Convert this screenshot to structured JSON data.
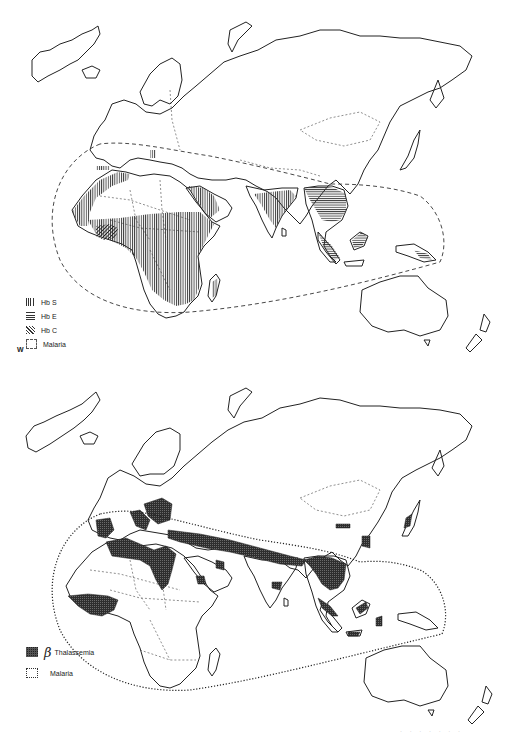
{
  "figure": {
    "panels": [
      {
        "id": "top",
        "title": "Hemoglobin variants and malaria distribution",
        "legend": [
          {
            "label": "Hb S",
            "pattern": "vertical-hatch"
          },
          {
            "label": "Hb E",
            "pattern": "horizontal-hatch"
          },
          {
            "label": "Hb C",
            "pattern": "diagonal-hatch"
          },
          {
            "label": "Malaria",
            "pattern": "dashed-outline"
          }
        ],
        "corner_mark": "W",
        "regions": [
          {
            "name": "Hb S",
            "areas": [
              "Sub-Saharan Africa",
              "North-west Africa",
              "Arabian Peninsula",
              "India",
              "Southern Spain",
              "Greece"
            ]
          },
          {
            "name": "Hb E",
            "areas": [
              "South-east Asia",
              "Bangladesh/Myanmar",
              "Thailand",
              "Malaysia",
              "Borneo",
              "New Guinea"
            ]
          },
          {
            "name": "Hb C",
            "areas": [
              "West Africa (Ghana/Burkina Faso)"
            ]
          }
        ],
        "malaria_boundary": "dashed"
      },
      {
        "id": "bottom",
        "title": "Beta thalassemia and malaria distribution",
        "legend": [
          {
            "label": "Thalassemia",
            "prefix": "β",
            "pattern": "solid-dark"
          },
          {
            "label": "Malaria",
            "pattern": "dotted-outline"
          }
        ],
        "regions": [
          {
            "name": "β Thalassemia",
            "areas": [
              "Mediterranean (Spain, Italy, Balkans)",
              "North Africa (Libya/Algeria)",
              "West Africa",
              "Middle East to India belt",
              "South-east Asia",
              "Southern China",
              "Indonesia",
              "Japan"
            ]
          }
        ],
        "malaria_boundary": "dotted"
      }
    ],
    "footer_show_through_text": "illegible"
  },
  "colors": {
    "ink": "#222222",
    "hatch": "#333333",
    "background": "#ffffff",
    "thalassemia_fill": "#3a3a3a"
  }
}
